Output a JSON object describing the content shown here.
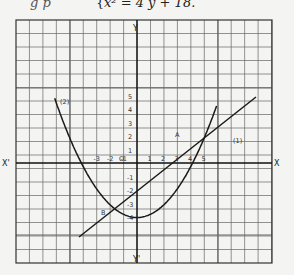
{
  "header": {
    "prefix": "g  p",
    "brace": "{",
    "equation": "x² = 4 y + 18."
  },
  "diagram": {
    "axis_labels": {
      "x_pos": "X",
      "x_neg": "X'",
      "y_pos": "Y",
      "y_neg": "Y'",
      "origin": "O"
    },
    "x_ticks": [
      "-3",
      "-2",
      "-1",
      "1",
      "2",
      "3",
      "4",
      "5"
    ],
    "y_ticks_pos": [
      "5",
      "4",
      "3",
      "2",
      "1"
    ],
    "y_ticks_neg": [
      "-1",
      "-2",
      "-3",
      "-4"
    ],
    "points": {
      "A": "A",
      "B": "B"
    },
    "curve_labels": {
      "line": "(1)",
      "parabola": "(2)"
    },
    "stroke_color": "#1a1a1a",
    "grid_color": "#555555"
  }
}
